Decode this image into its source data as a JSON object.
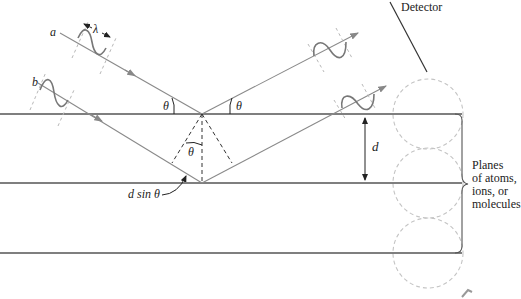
{
  "diagram": {
    "labels": {
      "ray_a": "a",
      "ray_b": "b",
      "wavelength": "λ",
      "theta_in": "θ",
      "theta_out": "θ",
      "theta_inner": "θ",
      "spacing": "d",
      "path_difference": "d sin θ",
      "detector": "Detector",
      "planes_line1": "Planes",
      "planes_line2": "of atoms,",
      "planes_line3": "ions, or",
      "planes_line4": "molecules"
    },
    "colors": {
      "plane_line": "#555555",
      "ray": "#8a8a8a",
      "wave": "#777777",
      "guide_dash": "#b8b8b8",
      "atom_circle": "#c4c4c4",
      "text": "#222222"
    }
  }
}
